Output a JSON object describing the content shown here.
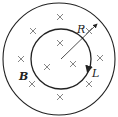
{
  "diagram": {
    "labels": {
      "radius": "R",
      "loop": "L",
      "field": "B"
    },
    "outer_circle": {
      "cx": 59,
      "cy": 59,
      "r": 56
    },
    "inner_circle": {
      "cx": 61,
      "cy": 59,
      "r": 30
    },
    "field_direction": "into page (×)",
    "crosses": [
      [
        60,
        17
      ],
      [
        33,
        31
      ],
      [
        60,
        43
      ],
      [
        21,
        59
      ],
      [
        47,
        67
      ],
      [
        73,
        64
      ],
      [
        100,
        58
      ],
      [
        32,
        84
      ],
      [
        89,
        84
      ],
      [
        60,
        97
      ],
      [
        89,
        31
      ]
    ],
    "colors": {
      "stroke": "#222222",
      "cross": "#777777"
    }
  }
}
